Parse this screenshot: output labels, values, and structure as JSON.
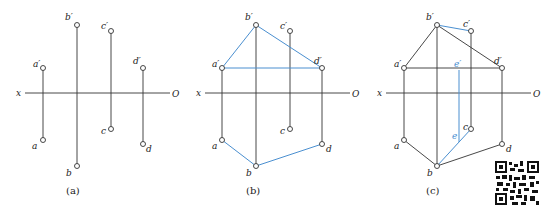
{
  "panels": [
    {
      "caption": "(a)",
      "x_label": "x",
      "o_label": "O",
      "points": {
        "a_prime": "a′",
        "b_prime": "b′",
        "c_prime": "c′",
        "d_prime": "d′",
        "a": "a",
        "b": "b",
        "c": "c",
        "d": "d"
      }
    },
    {
      "caption": "(b)",
      "x_label": "x",
      "o_label": "O",
      "points": {
        "a_prime": "a′",
        "b_prime": "b′",
        "c_prime": "c′",
        "d_prime": "d′",
        "a": "a",
        "b": "b",
        "c": "c",
        "d": "d"
      }
    },
    {
      "caption": "(c)",
      "x_label": "x",
      "o_label": "O",
      "points": {
        "a_prime": "a′",
        "b_prime": "b′",
        "c_prime": "c′",
        "d_prime": "d′",
        "a": "a",
        "b": "b",
        "c": "c",
        "d": "d",
        "e_prime": "e′",
        "e": "e"
      }
    }
  ],
  "colors": {
    "line": "#333333",
    "highlight": "#4a8fd0"
  },
  "qr_code": "qr-code"
}
